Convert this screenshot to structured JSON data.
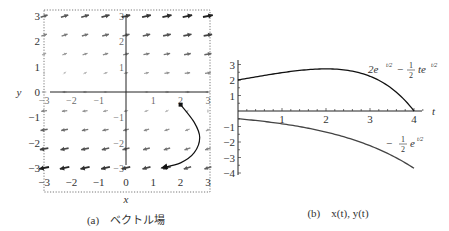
{
  "chart_data": [
    {
      "type": "vector_field",
      "caption": "(a)　ベクトル場",
      "caption_label": "(a)",
      "caption_text": "ベクトル場",
      "xlabel": "x",
      "ylabel": "y",
      "xlim": [
        -3,
        3
      ],
      "ylim": [
        -3,
        3
      ],
      "x_ticks": [
        "−3",
        "−2",
        "−1",
        "0",
        "1",
        "2",
        "3"
      ],
      "y_ticks": [
        "3",
        "2",
        "1",
        "0",
        "−1",
        "−2",
        "−3"
      ],
      "inner_x_ticks": [
        "−3",
        "−2",
        "−1",
        "1",
        "2",
        "3"
      ],
      "inner_y_ticks": [
        "3",
        "2",
        "1",
        "−1",
        "−2",
        "−3"
      ],
      "field": {
        "dx": "x/2 + 2y",
        "dy": "y/2"
      },
      "grid_n": 9,
      "trajectory": {
        "start": [
          2,
          -0.5
        ],
        "points": [
          [
            2,
            -0.5
          ],
          [
            2.5,
            -1.2
          ],
          [
            2.7,
            -1.8
          ],
          [
            2.5,
            -2.4
          ],
          [
            2.0,
            -2.8
          ],
          [
            1.3,
            -3.0
          ]
        ],
        "marker": "square-start, arrow-end"
      },
      "grid": false
    },
    {
      "type": "line",
      "caption": "(b)　x(t), y(t)",
      "caption_label": "(b)",
      "caption_text": "x(t), y(t)",
      "xlabel": "t",
      "xlim": [
        0,
        4.3
      ],
      "ylim": [
        -4,
        3
      ],
      "x_ticks": [
        "1",
        "2",
        "3",
        "4"
      ],
      "y_ticks": [
        "3",
        "2",
        "1",
        "−1",
        "−2",
        "−3",
        "−4"
      ],
      "series": [
        {
          "name": "x(t) = 2e^{t/2} − ½ t e^{t/2}",
          "label_parts": {
            "a": "2e",
            "sup1": "t/2",
            "minus": "−",
            "frac_num": "1",
            "frac_den": "2",
            "b": "te",
            "sup2": "t/2"
          },
          "x": [
            0,
            0.5,
            1,
            1.5,
            2,
            2.5,
            3,
            3.5,
            4
          ],
          "values": [
            2.0,
            2.25,
            2.47,
            2.65,
            2.72,
            2.62,
            2.24,
            1.44,
            0.0
          ]
        },
        {
          "name": "y(t) = −½ e^{t/2}",
          "label_parts": {
            "minus": "−",
            "frac_num": "1",
            "frac_den": "2",
            "b": "e",
            "sup": "t/2"
          },
          "x": [
            0,
            0.5,
            1,
            1.5,
            2,
            2.5,
            3,
            3.5,
            4
          ],
          "values": [
            -0.5,
            -0.64,
            -0.82,
            -1.06,
            -1.36,
            -1.75,
            -2.24,
            -2.88,
            -3.69
          ]
        }
      ],
      "grid": false
    }
  ]
}
